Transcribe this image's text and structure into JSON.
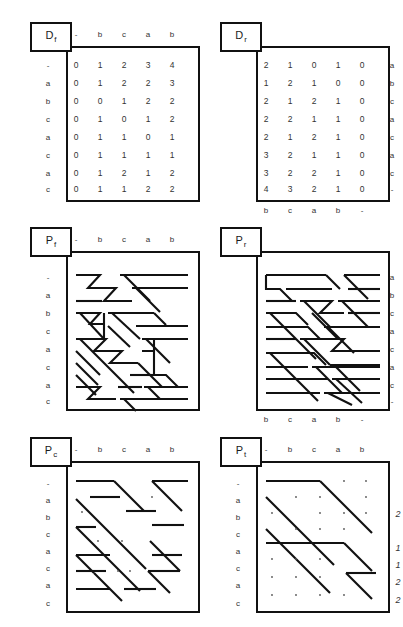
{
  "figure": {
    "title_visible": false,
    "background": "#ffffff",
    "ink": "#111111"
  },
  "alphabet": {
    "row_labels": [
      "-",
      "a",
      "b",
      "c",
      "a",
      "c",
      "a",
      "c"
    ],
    "col_labels": [
      "-",
      "b",
      "c",
      "a",
      "b"
    ],
    "row_labels_right": [
      "a",
      "b",
      "c",
      "a",
      "c",
      "a",
      "c",
      "-"
    ],
    "col_labels_bottom": [
      "b",
      "c",
      "a",
      "b",
      "-"
    ]
  },
  "panels": [
    {
      "id": "Df",
      "name": "matrix-df",
      "label_base": "D",
      "label_sub": "f",
      "position": "top-left",
      "headers_top": [
        "-",
        "b",
        "c",
        "a",
        "b"
      ],
      "headers_left": [
        "-",
        "a",
        "b",
        "c",
        "a",
        "c",
        "a",
        "c"
      ],
      "matrix": [
        [
          0,
          1,
          2,
          3,
          4
        ],
        [
          0,
          1,
          2,
          2,
          3
        ],
        [
          0,
          0,
          1,
          2,
          2
        ],
        [
          0,
          1,
          0,
          1,
          2
        ],
        [
          0,
          1,
          1,
          0,
          1
        ],
        [
          0,
          1,
          1,
          1,
          1
        ],
        [
          0,
          1,
          2,
          1,
          2
        ],
        [
          0,
          1,
          1,
          2,
          2
        ]
      ]
    },
    {
      "id": "Dr",
      "name": "matrix-dr",
      "label_base": "D",
      "label_sub": "r",
      "position": "top-right",
      "headers_right": [
        "a",
        "b",
        "c",
        "a",
        "c",
        "a",
        "c",
        "-"
      ],
      "headers_bottom": [
        "b",
        "c",
        "a",
        "b",
        "-"
      ],
      "matrix": [
        [
          2,
          1,
          0,
          1,
          0
        ],
        [
          1,
          2,
          1,
          0,
          0
        ],
        [
          2,
          1,
          2,
          1,
          0
        ],
        [
          2,
          2,
          1,
          1,
          0
        ],
        [
          2,
          1,
          2,
          1,
          0
        ],
        [
          3,
          2,
          1,
          1,
          0
        ],
        [
          3,
          2,
          2,
          1,
          0
        ],
        [
          4,
          3,
          2,
          1,
          0
        ]
      ]
    },
    {
      "id": "Pf",
      "name": "path-diagram-pf",
      "label_base": "P",
      "label_sub": "f",
      "position": "middle-left",
      "headers_top": [
        "-",
        "b",
        "c",
        "a",
        "b"
      ],
      "headers_left": [
        "-",
        "a",
        "b",
        "c",
        "a",
        "c",
        "a",
        "c"
      ]
    },
    {
      "id": "Pr",
      "name": "path-diagram-pr",
      "label_base": "P",
      "label_sub": "r",
      "position": "middle-right",
      "headers_right": [
        "a",
        "b",
        "c",
        "a",
        "c",
        "a",
        "c",
        "-"
      ],
      "headers_bottom": [
        "b",
        "c",
        "a",
        "b",
        "-"
      ]
    },
    {
      "id": "Pc",
      "name": "path-diagram-pc",
      "label_base": "P",
      "label_sub": "c",
      "position": "bottom-left",
      "headers_top": [
        "-",
        "b",
        "c",
        "a",
        "b"
      ],
      "headers_left": [
        "-",
        "a",
        "b",
        "c",
        "a",
        "c",
        "a",
        "c"
      ]
    },
    {
      "id": "Pt",
      "name": "path-diagram-pt",
      "label_base": "P",
      "label_sub": "t",
      "position": "bottom-right",
      "headers_top": [
        "-",
        "b",
        "c",
        "a",
        "b"
      ],
      "headers_left": [
        "-",
        "a",
        "b",
        "c",
        "a",
        "c",
        "a",
        "c"
      ],
      "side_values": [
        "2",
        "1",
        "1",
        "2",
        "2"
      ],
      "side_value_rows": [
        2,
        4,
        5,
        6,
        7
      ]
    }
  ]
}
